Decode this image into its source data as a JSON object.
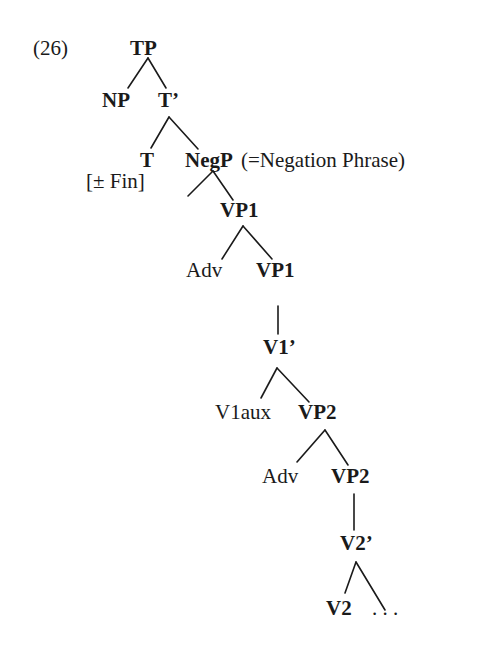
{
  "example_number": "(26)",
  "tree": {
    "root": "TP",
    "nodes": {
      "tp": "TP",
      "np": "NP",
      "t_bar": "T’",
      "t": "T",
      "t_feature": "[± Fin]",
      "negp": "NegP",
      "negp_gloss": "(=Negation Phrase)",
      "vp1_top": "VP1",
      "adv1": "Adv",
      "vp1_lower": "VP1",
      "v1_bar": "V1’",
      "v1aux": "V1aux",
      "vp2_top": "VP2",
      "adv2": "Adv",
      "vp2_lower": "VP2",
      "v2_bar": "V2’",
      "v2": "V2",
      "ellipsis": ". . ."
    },
    "edges": [
      [
        "TP",
        "NP"
      ],
      [
        "TP",
        "T’"
      ],
      [
        "T’",
        "T"
      ],
      [
        "T’",
        "NegP"
      ],
      [
        "NegP",
        ""
      ],
      [
        "NegP",
        "VP1"
      ],
      [
        "VP1",
        "Adv"
      ],
      [
        "VP1",
        "VP1"
      ],
      [
        "VP1",
        "V1’"
      ],
      [
        "V1’",
        "V1aux"
      ],
      [
        "V1’",
        "VP2"
      ],
      [
        "VP2",
        "Adv"
      ],
      [
        "VP2",
        "VP2"
      ],
      [
        "VP2",
        "V2’"
      ],
      [
        "V2’",
        "V2"
      ],
      [
        "V2’",
        ". . ."
      ]
    ]
  }
}
